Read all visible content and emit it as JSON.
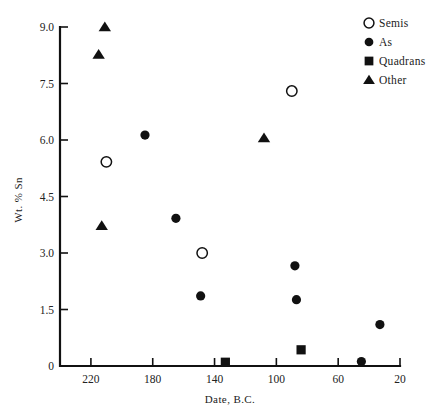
{
  "chart_data": {
    "type": "scatter",
    "title": "",
    "xlabel": "Date, B.C.",
    "ylabel": "Wt. % Sn",
    "xlim": [
      240,
      20
    ],
    "ylim": [
      0,
      9.0
    ],
    "x_ticks": [
      220,
      180,
      140,
      100,
      60,
      20
    ],
    "x_tick_labels": [
      "220",
      "180",
      "140",
      "100",
      "60",
      "20"
    ],
    "y_ticks": [
      0,
      1.5,
      3.0,
      4.5,
      6.0,
      7.5,
      9.0
    ],
    "y_tick_labels": [
      "0",
      "1.5",
      "3.0",
      "4.5",
      "6.0",
      "7.5",
      "9.0"
    ],
    "x_axis_inverted": true,
    "grid": false,
    "legend_position": "top-right",
    "series": [
      {
        "name": "Semis",
        "marker": "open-circle",
        "color": "#111111",
        "points": [
          {
            "x": 210,
            "y": 5.42
          },
          {
            "x": 148,
            "y": 3.0
          },
          {
            "x": 90,
            "y": 7.3
          }
        ]
      },
      {
        "name": "As",
        "marker": "filled-circle",
        "color": "#111111",
        "points": [
          {
            "x": 185,
            "y": 6.13
          },
          {
            "x": 165,
            "y": 3.92
          },
          {
            "x": 149,
            "y": 1.86
          },
          {
            "x": 88,
            "y": 2.66
          },
          {
            "x": 87,
            "y": 1.76
          },
          {
            "x": 45,
            "y": 0.12
          },
          {
            "x": 33,
            "y": 1.1
          }
        ]
      },
      {
        "name": "Quadrans",
        "marker": "filled-square",
        "color": "#111111",
        "points": [
          {
            "x": 133,
            "y": 0.1
          },
          {
            "x": 84,
            "y": 0.43
          }
        ]
      },
      {
        "name": "Other",
        "marker": "filled-triangle",
        "color": "#111111",
        "points": [
          {
            "x": 211,
            "y": 9.0
          },
          {
            "x": 215,
            "y": 8.27
          },
          {
            "x": 213,
            "y": 3.72
          },
          {
            "x": 108,
            "y": 6.05
          }
        ]
      }
    ]
  },
  "legend": {
    "entries": [
      {
        "label": "Semis",
        "marker": "open-circle"
      },
      {
        "label": "As",
        "marker": "filled-circle"
      },
      {
        "label": "Quadrans",
        "marker": "filled-square"
      },
      {
        "label": "Other",
        "marker": "filled-triangle"
      }
    ]
  },
  "axes": {
    "x_label": "Date, B.C.",
    "y_label": "Wt. % Sn"
  }
}
